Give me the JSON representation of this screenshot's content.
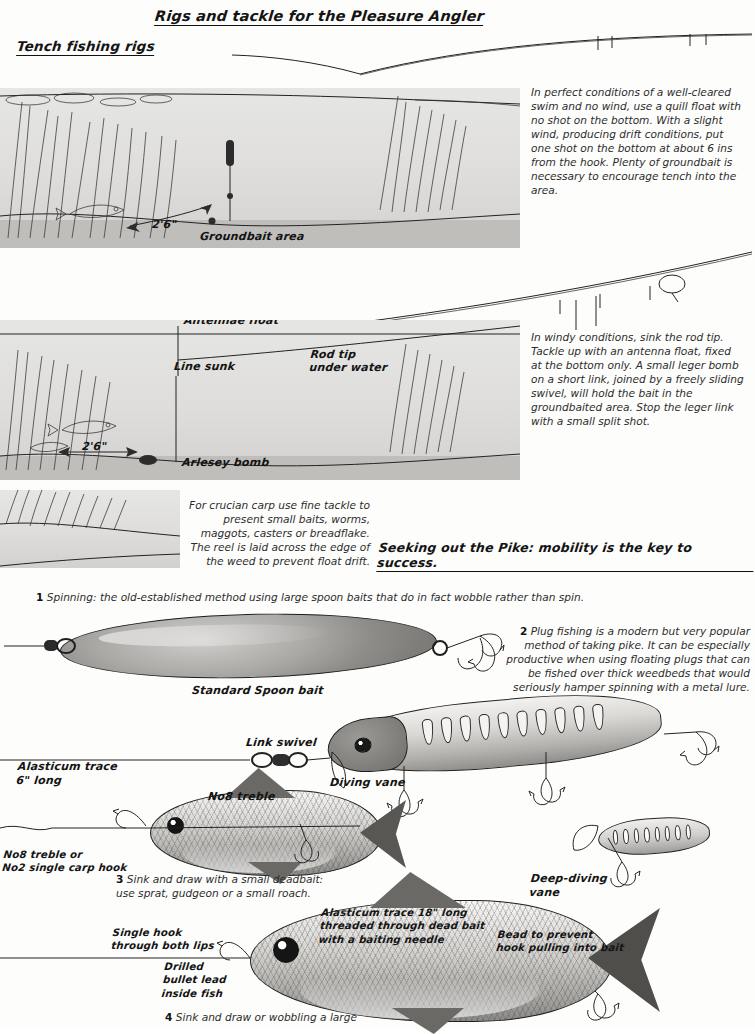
{
  "page": {
    "main_title": "Rigs and tackle for the Pleasure Angler",
    "section_1_title": "Tench fishing rigs",
    "section_2_title": "Seeking out the Pike: mobility is the key to success."
  },
  "diagram_1": {
    "name": "quill-float-rig",
    "labels": {
      "depth": "2'6\"",
      "groundbait": "Groundbait area"
    },
    "description": "In perfect conditions of a well-cleared swim and no wind, use a quill float with no shot on the bottom. With a slight wind, producing drift conditions, put one shot on the bottom at about 6 ins from the hook. Plenty of groundbait is necessary to encourage tench into the area."
  },
  "diagram_2": {
    "name": "antenna-float-leger-rig",
    "labels": {
      "antennae_float": "Antennae float",
      "line_sunk": "Line sunk",
      "rod_tip": "Rod tip\nunder water",
      "depth": "2'6\"",
      "arlesey_bomb": "Arlesey bomb"
    },
    "description": "In windy conditions, sink the rod tip. Tackle up with an antenna float, fixed at the bottom only. A small leger bomb on a short link, joined by a freely sliding swivel, will hold the bait in the groundbaited area. Stop the leger link with a small split shot."
  },
  "diagram_3": {
    "name": "crucian-carp-rig",
    "description": "For crucian carp use fine tackle to present small baits, worms, maggots, casters or breadflake. The reel is laid across the edge of the weed to prevent float drift."
  },
  "pike_methods": [
    {
      "number": "1",
      "text": "Spinning: the old-established method using large spoon baits that do in fact wobble rather than spin."
    },
    {
      "number": "2",
      "text": "Plug fishing is a modern but very popular method of taking pike. It can be especially productive when using floating plugs that can be fished over thick weedbeds that would seriously hamper spinning with a metal lure."
    },
    {
      "number": "3",
      "text": "Sink and draw with a small deadbait: use sprat, gudgeon or a small roach."
    },
    {
      "number": "4",
      "text": "Sink and draw or wobbling a large"
    }
  ],
  "tackle_labels": {
    "standard_spoon": "Standard Spoon bait",
    "link_swivel": "Link swivel",
    "diving_vane": "Diving vane",
    "deep_diving_vane": "Deep-diving\nvane",
    "alasticum_trace_6": "Alasticum trace\n6\" long",
    "no8_treble": "No8 treble",
    "no8_treble_or_no2": "No8 treble or\nNo2 single carp hook",
    "alasticum_trace_18": "Alasticum trace 18\" long\nthreaded through dead bait\nwith a baiting needle",
    "bead": "Bead to prevent\nhook pulling into bait",
    "single_hook": "Single hook\nthrough both lips",
    "drilled_bullet": "Drilled\nbullet lead\ninside fish"
  },
  "colors": {
    "ink": "#1b1b1b",
    "water": "#dedddb",
    "bed": "#bfbebb",
    "paper": "#fdfdfc"
  }
}
